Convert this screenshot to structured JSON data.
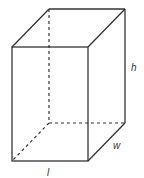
{
  "diagram": {
    "type": "rectangular-prism",
    "stroke_color": "#333333",
    "background": "#ffffff",
    "labels": {
      "height": "h",
      "width": "w",
      "length": "l"
    }
  }
}
